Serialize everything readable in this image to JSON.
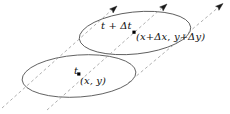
{
  "figure": {
    "background_color": "#ffffff",
    "width": 230,
    "height": 114
  },
  "colors": {
    "ellipse_stroke": "#555555",
    "flow_line_stroke": "#9a9a9a",
    "arrow_head_fill": "#1a1a1a",
    "point_dot_fill": "#000000",
    "label_color": "#111111"
  },
  "surfaces": [
    {
      "id": "upper-surface",
      "time_label": "t + Δt",
      "point_label": "(x+Δx, y+Δy)",
      "center": {
        "cx": 135,
        "cy": 33
      },
      "rx": 56,
      "ry": 21,
      "rotation_deg": -6,
      "point": {
        "x": 134,
        "y": 32
      }
    },
    {
      "id": "lower-surface",
      "time_label": "t",
      "point_label": "(x, y)",
      "center": {
        "cx": 79,
        "cy": 76
      },
      "rx": 57,
      "ry": 21,
      "rotation_deg": -4,
      "point": {
        "x": 79,
        "y": 74
      }
    }
  ],
  "flow_lines": [
    {
      "id": "flow-line-left",
      "start": {
        "x": 2,
        "y": 108
      },
      "end": {
        "x": 116,
        "y": 7
      },
      "arrow_angle_deg": -41
    },
    {
      "id": "flow-line-middle",
      "start": {
        "x": 47,
        "y": 110
      },
      "end": {
        "x": 166,
        "y": 5
      },
      "arrow_angle_deg": -41
    },
    {
      "id": "flow-line-right",
      "start": {
        "x": 128,
        "y": 83
      },
      "end": {
        "x": 222,
        "y": 4
      },
      "arrow_angle_deg": -40
    }
  ],
  "labels": {
    "upper_time": "t + Δt",
    "upper_coord_open": "(",
    "upper_coord_x": "x",
    "upper_coord_plus1": "+",
    "upper_coord_dx": "Δx",
    "upper_coord_comma": ", ",
    "upper_coord_y": "y",
    "upper_coord_plus2": "+",
    "upper_coord_dy": "Δy",
    "upper_coord_close": ")",
    "lower_time": "t",
    "lower_coord": "(x, y)"
  },
  "icons": {
    "arrow_head": "arrow-head-icon",
    "point_marker": "point-marker-icon"
  }
}
